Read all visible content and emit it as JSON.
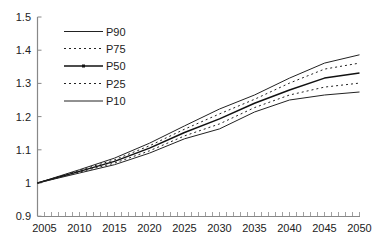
{
  "chart_data": {
    "type": "line",
    "title": "",
    "xlabel": "",
    "ylabel": "",
    "x": [
      2004,
      2010,
      2015,
      2020,
      2025,
      2030,
      2035,
      2040,
      2045,
      2050
    ],
    "xlim": [
      2004,
      2050
    ],
    "ylim": [
      0.9,
      1.5
    ],
    "x_ticks": [
      "2005",
      "2010",
      "2015",
      "2020",
      "2025",
      "2030",
      "2035",
      "2040",
      "2045",
      "2050"
    ],
    "y_ticks": [
      "0.9",
      "1",
      "1.1",
      "1.2",
      "1.3",
      "1.4",
      "1.5"
    ],
    "grid": false,
    "legend_position": "upper-left",
    "series": [
      {
        "name": "P90",
        "style": "solid",
        "values": [
          1.0,
          1.04,
          1.075,
          1.12,
          1.172,
          1.223,
          1.265,
          1.316,
          1.361,
          1.386
        ]
      },
      {
        "name": "P75",
        "style": "dotted",
        "values": [
          1.0,
          1.038,
          1.07,
          1.112,
          1.162,
          1.208,
          1.252,
          1.301,
          1.343,
          1.361
        ]
      },
      {
        "name": "P50",
        "style": "solid-bold-marker",
        "values": [
          1.0,
          1.035,
          1.065,
          1.105,
          1.152,
          1.193,
          1.24,
          1.28,
          1.316,
          1.331
        ]
      },
      {
        "name": "P25",
        "style": "dotted",
        "values": [
          1.0,
          1.033,
          1.06,
          1.097,
          1.142,
          1.178,
          1.227,
          1.265,
          1.289,
          1.301
        ]
      },
      {
        "name": "P10",
        "style": "solid",
        "values": [
          1.0,
          1.03,
          1.055,
          1.09,
          1.133,
          1.163,
          1.214,
          1.25,
          1.265,
          1.274
        ]
      }
    ]
  },
  "legend": {
    "items": [
      {
        "label": "P90"
      },
      {
        "label": "P75"
      },
      {
        "label": "P50"
      },
      {
        "label": "P25"
      },
      {
        "label": "P10"
      }
    ]
  },
  "axes": {
    "x_labels": [
      "2005",
      "2010",
      "2015",
      "2020",
      "2025",
      "2030",
      "2035",
      "2040",
      "2045",
      "2050"
    ],
    "y_labels": [
      "0.9",
      "1",
      "1.1",
      "1.2",
      "1.3",
      "1.4",
      "1.5"
    ]
  },
  "colors": {
    "axis": "#888888",
    "line": "#222222",
    "text": "#222222"
  }
}
